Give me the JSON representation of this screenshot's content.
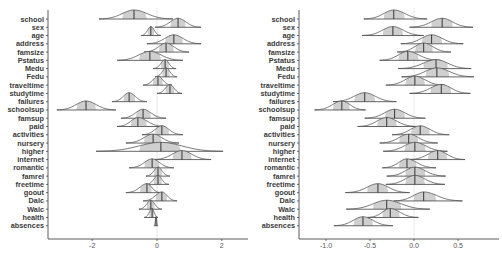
{
  "chart_data": [
    {
      "type": "ridgeline",
      "title": "",
      "xlabel": "",
      "ylabel": "",
      "xlim": [
        -3.3,
        2.8
      ],
      "xticks": [
        -2,
        0,
        2
      ],
      "xtick_labels": [
        "-2",
        "0",
        "2"
      ],
      "grid": false,
      "zero_reference_line": true,
      "categories": [
        "school",
        "sex",
        "age",
        "address",
        "famsize",
        "Pstatus",
        "Medu",
        "Fedu",
        "traveltime",
        "studytime",
        "failures",
        "schoolsup",
        "famsup",
        "paid",
        "activities",
        "nursery",
        "higher",
        "internet",
        "romantic",
        "famrel",
        "freetime",
        "goout",
        "Dalc",
        "Walc",
        "health",
        "absences"
      ],
      "series": [
        {
          "name": "median",
          "values": [
            -0.71,
            0.65,
            -0.19,
            0.52,
            0.28,
            -0.22,
            0.25,
            0.28,
            0.03,
            0.4,
            -0.86,
            -2.19,
            -0.43,
            -0.59,
            0.15,
            -0.12,
            0.12,
            0.77,
            -0.15,
            0.03,
            0.03,
            -0.31,
            0.15,
            -0.19,
            -0.15,
            -0.03
          ]
        },
        {
          "name": "lower",
          "values": [
            -1.79,
            -0.06,
            -0.49,
            -0.31,
            -0.4,
            -1.23,
            -0.12,
            -0.06,
            -0.43,
            0.0,
            -1.39,
            -3.09,
            -1.11,
            -1.23,
            -0.46,
            -0.96,
            -1.88,
            -0.12,
            -0.86,
            -0.34,
            -0.34,
            -0.96,
            -0.43,
            -0.56,
            -0.4,
            -0.09
          ]
        },
        {
          "name": "upper",
          "values": [
            0.49,
            1.36,
            0.12,
            1.36,
            0.99,
            0.8,
            0.59,
            0.62,
            0.46,
            0.77,
            -0.31,
            -1.27,
            0.28,
            0.25,
            0.8,
            0.68,
            2.04,
            1.67,
            0.52,
            0.4,
            0.37,
            0.12,
            0.62,
            0.15,
            0.03,
            0.03
          ]
        }
      ]
    },
    {
      "type": "ridgeline",
      "title": "",
      "xlabel": "",
      "ylabel": "",
      "xlim": [
        -1.3,
        0.85
      ],
      "xticks": [
        -1.0,
        -0.5,
        0.0,
        0.5
      ],
      "xtick_labels": [
        "-1.0",
        "-0.5",
        "0.0",
        "0.5"
      ],
      "grid": false,
      "zero_reference_line": true,
      "categories": [
        "school",
        "sex",
        "age",
        "address",
        "famsize",
        "Pstatus",
        "Medu",
        "Fedu",
        "traveltime",
        "studytime",
        "failures",
        "schoolsup",
        "famsup",
        "paid",
        "activities",
        "nursery",
        "higher",
        "internet",
        "romantic",
        "famrel",
        "freetime",
        "goout",
        "Dalc",
        "Walc",
        "health",
        "absences"
      ],
      "series": [
        {
          "name": "median",
          "values": [
            -0.23,
            0.32,
            -0.24,
            0.2,
            0.11,
            -0.07,
            0.25,
            0.26,
            0.01,
            0.31,
            -0.56,
            -0.82,
            -0.22,
            -0.31,
            0.07,
            -0.06,
            0.01,
            0.27,
            -0.08,
            0.01,
            0.01,
            -0.41,
            0.11,
            -0.31,
            -0.27,
            -0.58
          ]
        },
        {
          "name": "lower",
          "values": [
            -0.57,
            -0.05,
            -0.59,
            -0.15,
            -0.19,
            -0.39,
            -0.18,
            -0.14,
            -0.32,
            -0.05,
            -0.92,
            -1.13,
            -0.56,
            -0.64,
            -0.25,
            -0.39,
            -0.35,
            -0.06,
            -0.36,
            -0.31,
            -0.32,
            -0.78,
            -0.23,
            -0.77,
            -0.53,
            -0.91
          ]
        },
        {
          "name": "upper",
          "values": [
            0.15,
            0.67,
            0.11,
            0.56,
            0.42,
            0.3,
            0.65,
            0.68,
            0.35,
            0.64,
            -0.2,
            -0.55,
            0.13,
            0.03,
            0.4,
            0.27,
            0.38,
            0.58,
            0.25,
            0.36,
            0.35,
            -0.05,
            0.55,
            0.18,
            0.05,
            -0.24
          ]
        }
      ]
    }
  ],
  "colors": {
    "outline": "#555555",
    "band": "#cfcfcf",
    "median": "#333333",
    "axis": "#333333",
    "ref": "#e3e3e3"
  }
}
